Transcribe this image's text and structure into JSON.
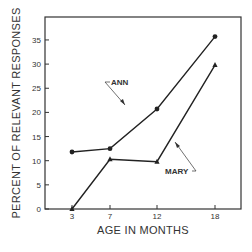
{
  "chart_data": {
    "type": "line",
    "title": "",
    "xlabel": "AGE IN MONTHS",
    "ylabel": "PERCENT OF RELEVANT RESPONSES",
    "x": [
      3,
      7,
      12,
      18
    ],
    "x_tick_labels": [
      "3",
      "7",
      "12",
      "18"
    ],
    "y_ticks": [
      0,
      5,
      10,
      15,
      20,
      25,
      30,
      35
    ],
    "y_tick_labels": [
      "0",
      "5",
      "10",
      "15",
      "20",
      "25",
      "30",
      "35"
    ],
    "ylim": [
      0,
      40
    ],
    "xlim": [
      0,
      21
    ],
    "grid": false,
    "legend": "inline annotations with arrows",
    "series": [
      {
        "name": "ANN",
        "marker": "circle",
        "values": [
          11.8,
          12.5,
          20.7,
          35.7
        ]
      },
      {
        "name": "MARY",
        "marker": "triangle",
        "values": [
          0,
          10.3,
          9.8,
          29.8
        ]
      }
    ],
    "annotations": [
      {
        "text": "ANN",
        "points_to": {
          "series": "ANN",
          "x": 12
        }
      },
      {
        "text": "MARY",
        "points_to": {
          "series": "MARY",
          "x": 15
        }
      }
    ]
  },
  "colors": {
    "line": "#222222",
    "frame": "#333333",
    "text": "#333333"
  }
}
